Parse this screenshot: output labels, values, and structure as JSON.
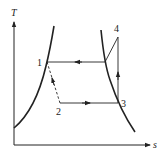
{
  "diagram": {
    "type": "T-s diagram",
    "axes": {
      "y_label": "T",
      "x_label": "s"
    },
    "points": [
      {
        "id": "1",
        "label": "1",
        "x": 47,
        "y": 62
      },
      {
        "id": "2",
        "label": "2",
        "x": 60,
        "y": 103
      },
      {
        "id": "3",
        "label": "3",
        "x": 118,
        "y": 103
      },
      {
        "id": "4",
        "label": "4",
        "x": 118,
        "y": 37
      }
    ],
    "edges": [
      {
        "from": "4",
        "to": "sat-vapor",
        "style": "solid",
        "note": "desuperheating"
      },
      {
        "from": "sat-vapor",
        "to": "1",
        "style": "solid",
        "arrow": "left",
        "note": "condensation"
      },
      {
        "from": "1",
        "to": "2",
        "style": "dashed",
        "arrow": "toward-1",
        "note": "throttling"
      },
      {
        "from": "2",
        "to": "3",
        "style": "solid",
        "arrow": "right",
        "note": "evaporation"
      },
      {
        "from": "3",
        "to": "4",
        "style": "solid",
        "arrow": "up",
        "note": "compression"
      }
    ],
    "colors": {
      "stroke": "#222222",
      "background": "#ffffff"
    }
  }
}
